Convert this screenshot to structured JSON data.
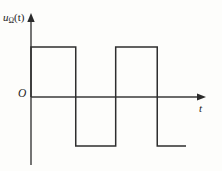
{
  "figure": {
    "title": "",
    "y_axis_label_main": "u",
    "y_axis_label_subscript": "Ω",
    "y_axis_label_arg": "(t)",
    "origin_label": "O",
    "x_axis_label": "t",
    "line_color": "#2e2e2e",
    "axis_color": "#3a3a3a",
    "background_color": "#fdfdfb"
  },
  "chart_data": {
    "type": "line",
    "title": "",
    "xlabel": "t",
    "ylabel": "uΩ(t)",
    "grid": false,
    "legend": null,
    "axis_origin_label": "O",
    "xlim": [
      0,
      10
    ],
    "ylim": [
      -1.2,
      1.2
    ],
    "amplitude_high": 1,
    "amplitude_low": -1,
    "series": [
      {
        "name": "uΩ(t)",
        "x": [
          0,
          0,
          2.8,
          2.8,
          5.3,
          5.3,
          7.9,
          7.9,
          9.7
        ],
        "y": [
          0,
          1,
          1,
          -1,
          -1,
          1,
          1,
          -1,
          -1
        ]
      }
    ],
    "transitions": [
      {
        "x": 0.0,
        "from": 0,
        "to": 1
      },
      {
        "x": 2.8,
        "from": 1,
        "to": -1
      },
      {
        "x": 5.3,
        "from": -1,
        "to": 1
      },
      {
        "x": 7.9,
        "from": 1,
        "to": -1
      }
    ],
    "segments": [
      {
        "level": "high",
        "x_start": 0.0,
        "x_end": 2.8
      },
      {
        "level": "low",
        "x_start": 2.8,
        "x_end": 5.3
      },
      {
        "level": "high",
        "x_start": 5.3,
        "x_end": 7.9
      },
      {
        "level": "low",
        "x_start": 7.9,
        "x_end": 9.7
      }
    ]
  }
}
